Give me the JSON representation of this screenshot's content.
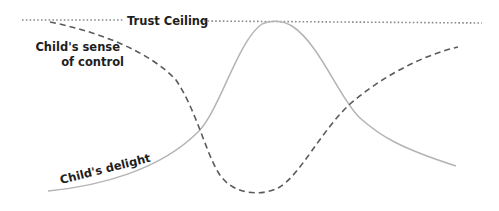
{
  "diagram": {
    "ceiling": {
      "label": "Trust Ceiling",
      "style": "dotted",
      "color": "#8a8a8a"
    },
    "curves": [
      {
        "id": "control",
        "label_line1": "Child's sense",
        "label_line2": "of control",
        "style": "dashed",
        "color": "#5a5a5a",
        "shape": "starts at ceiling on left, falls to minimum near center (x~260), rises toward right"
      },
      {
        "id": "delight",
        "label": "Child's delight",
        "style": "solid",
        "color": "#b4b4b4",
        "shape": "bell curve rising from bottom-left, peaking at ceiling near x~270, falling to bottom-right"
      }
    ]
  }
}
